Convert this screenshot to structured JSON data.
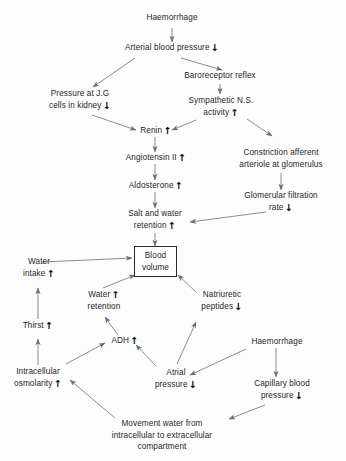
{
  "diagram": {
    "line_color": "#6e6e6e",
    "text_color": "#1f1f1f",
    "background": "#fdfdfd",
    "up_arrow": "↑",
    "down_arrow": "↓"
  },
  "nodes": [
    {
      "id": "haemorrhage_top",
      "lines": [
        "Haemorrhage"
      ],
      "change": ""
    },
    {
      "id": "arterial_bp",
      "lines": [
        "Arterial blood pressure"
      ],
      "change": "down"
    },
    {
      "id": "baroreceptor_reflex",
      "lines": [
        "Baroreceptor reflex"
      ],
      "change": ""
    },
    {
      "id": "pressure_jg",
      "lines": [
        "Pressure at J.G",
        "cells in kidney"
      ],
      "change": "down"
    },
    {
      "id": "sympathetic_ns",
      "lines": [
        "Sympathetic N.S.",
        "activity"
      ],
      "change": "up"
    },
    {
      "id": "renin",
      "lines": [
        "Renin"
      ],
      "change": "up"
    },
    {
      "id": "constriction_afferent",
      "lines": [
        "Constriction afferent",
        "arteriole at glomerulus"
      ],
      "change": ""
    },
    {
      "id": "angiotensin_ii",
      "lines": [
        "Angiotensin II"
      ],
      "change": "up"
    },
    {
      "id": "aldosterone",
      "lines": [
        "Aldosterone"
      ],
      "change": "up"
    },
    {
      "id": "glomerular_filtration_rate",
      "lines": [
        "Glomerular filtration",
        "rate"
      ],
      "change": "down"
    },
    {
      "id": "salt_water_retention",
      "lines": [
        "Salt and water",
        "retention"
      ],
      "change": "up"
    },
    {
      "id": "blood_volume",
      "lines": [
        "Blood",
        "volume"
      ],
      "change": ""
    },
    {
      "id": "water_intake",
      "lines": [
        "Water",
        "intake"
      ],
      "change": "up"
    },
    {
      "id": "water_retention",
      "lines": [
        "Water",
        "retention"
      ],
      "change": "up"
    },
    {
      "id": "natriuretic_peptides",
      "lines": [
        "Natriuretic",
        "peptides"
      ],
      "change": "down"
    },
    {
      "id": "thirst",
      "lines": [
        "Thirst"
      ],
      "change": "up"
    },
    {
      "id": "adh",
      "lines": [
        "ADH"
      ],
      "change": "up"
    },
    {
      "id": "haemorrhage_lower",
      "lines": [
        "Haemorrhage"
      ],
      "change": ""
    },
    {
      "id": "intracellular_osmolarity",
      "lines": [
        "Intracellular",
        "osmolarity"
      ],
      "change": "up"
    },
    {
      "id": "atrial_pressure",
      "lines": [
        "Atrial",
        "pressure"
      ],
      "change": "down"
    },
    {
      "id": "capillary_blood_pressure",
      "lines": [
        "Capillary blood",
        "pressure"
      ],
      "change": "down"
    },
    {
      "id": "movement_water",
      "lines": [
        "Movement water from",
        "intracellular to extracellular",
        "compartment"
      ],
      "change": ""
    }
  ],
  "text": {
    "haemorrhage_top": {
      "l0": "Haemorrhage"
    },
    "arterial_bp": {
      "l0": "Arterial blood pressure",
      "arrow": "↓"
    },
    "baroreceptor_reflex": {
      "l0": "Baroreceptor reflex"
    },
    "pressure_jg": {
      "l0": "Pressure at J.G",
      "l1": "cells in kidney",
      "arrow": "↓"
    },
    "sympathetic_ns": {
      "l0": "Sympathetic N.S.",
      "l1": "activity",
      "arrow": "↑"
    },
    "renin": {
      "l0": "Renin",
      "arrow": "↑"
    },
    "constriction_afferent": {
      "l0": "Constriction afferent",
      "l1": "arteriole at glomerulus"
    },
    "angiotensin_ii": {
      "l0": "Angiotensin II",
      "arrow": "↑"
    },
    "aldosterone": {
      "l0": "Aldosterone",
      "arrow": "↑"
    },
    "glomerular_filtration_rate": {
      "l0": "Glomerular filtration",
      "l1": "rate",
      "arrow": "↓"
    },
    "salt_water_retention": {
      "l0": "Salt and water",
      "l1": "retention",
      "arrow": "↑"
    },
    "blood_volume": {
      "l0": "Blood",
      "l1": "volume"
    },
    "water_intake": {
      "l0": "Water",
      "l1": "intake",
      "arrow": "↑"
    },
    "water_retention": {
      "l0": "Water",
      "l1": "retention",
      "arrow": "↑"
    },
    "natriuretic_peptides": {
      "l0": "Natriuretic",
      "l1": "peptides",
      "arrow": "↓"
    },
    "thirst": {
      "l0": "Thirst",
      "arrow": "↑"
    },
    "adh": {
      "l0": "ADH",
      "arrow": "↑"
    },
    "haemorrhage_lower": {
      "l0": "Haemorrhage"
    },
    "intracellular_osmolarity": {
      "l0": "Intracellular",
      "l1": "osmolarity",
      "arrow": "↑"
    },
    "atrial_pressure": {
      "l0": "Atrial",
      "l1": "pressure",
      "arrow": "↓"
    },
    "capillary_blood_pressure": {
      "l0": "Capillary blood",
      "l1": "pressure",
      "arrow": "↓"
    },
    "movement_water": {
      "l0": "Movement water from",
      "l1": "intracellular to extracellular",
      "l2": "compartment"
    }
  },
  "edges": [
    {
      "from": "haemorrhage_top",
      "to": "arterial_bp"
    },
    {
      "from": "arterial_bp",
      "to": "pressure_jg"
    },
    {
      "from": "arterial_bp",
      "to": "baroreceptor_reflex"
    },
    {
      "from": "baroreceptor_reflex",
      "to": "sympathetic_ns"
    },
    {
      "from": "pressure_jg",
      "to": "renin"
    },
    {
      "from": "sympathetic_ns",
      "to": "renin"
    },
    {
      "from": "sympathetic_ns",
      "to": "constriction_afferent"
    },
    {
      "from": "renin",
      "to": "angiotensin_ii"
    },
    {
      "from": "angiotensin_ii",
      "to": "aldosterone"
    },
    {
      "from": "aldosterone",
      "to": "salt_water_retention"
    },
    {
      "from": "constriction_afferent",
      "to": "glomerular_filtration_rate"
    },
    {
      "from": "glomerular_filtration_rate",
      "to": "salt_water_retention"
    },
    {
      "from": "salt_water_retention",
      "to": "blood_volume"
    },
    {
      "from": "water_intake",
      "to": "blood_volume"
    },
    {
      "from": "water_retention",
      "to": "blood_volume"
    },
    {
      "from": "natriuretic_peptides",
      "to": "blood_volume"
    },
    {
      "from": "thirst",
      "to": "water_intake"
    },
    {
      "from": "intracellular_osmolarity",
      "to": "thirst"
    },
    {
      "from": "adh",
      "to": "water_retention"
    },
    {
      "from": "intracellular_osmolarity",
      "to": "adh"
    },
    {
      "from": "atrial_pressure",
      "to": "adh"
    },
    {
      "from": "atrial_pressure",
      "to": "natriuretic_peptides"
    },
    {
      "from": "haemorrhage_lower",
      "to": "atrial_pressure"
    },
    {
      "from": "haemorrhage_lower",
      "to": "capillary_blood_pressure"
    },
    {
      "from": "capillary_blood_pressure",
      "to": "movement_water"
    },
    {
      "from": "movement_water",
      "to": "intracellular_osmolarity"
    }
  ]
}
